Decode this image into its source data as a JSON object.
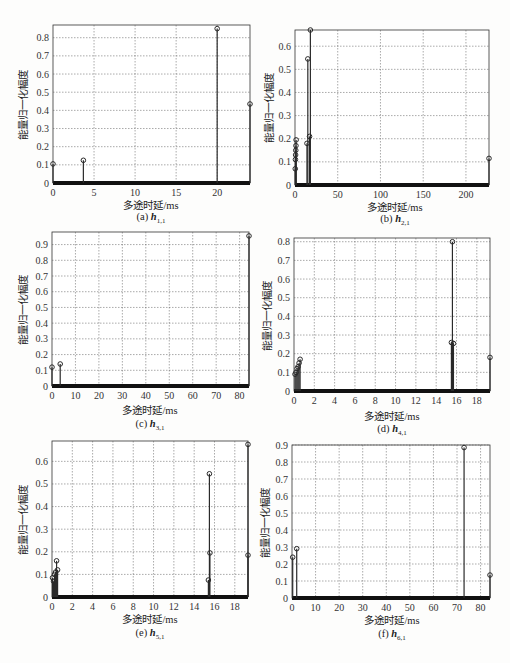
{
  "figure": {
    "xlabel": "多途时延/ms",
    "ylabel": "能量归一化幅度"
  },
  "colors": {
    "stem": "#2a2a2a",
    "grid": "#555555",
    "frame": "#333333",
    "baseline": "#111111"
  },
  "chart_data": [
    {
      "id": "a",
      "type": "stem",
      "caption": "(a)",
      "symbol": "h",
      "subscript": "1,1",
      "xlabel": "多途时延/ms",
      "ylabel": "能量归一化幅度",
      "xlim": [
        0,
        24
      ],
      "ylim": [
        0,
        0.87
      ],
      "xticks": [
        0,
        5,
        10,
        15,
        20
      ],
      "yticks": [
        0,
        0.1,
        0.2,
        0.3,
        0.4,
        0.5,
        0.6,
        0.7,
        0.8
      ],
      "grid": true,
      "x": [
        0,
        3.7,
        20,
        24
      ],
      "y": [
        0.105,
        0.125,
        0.85,
        0.435
      ]
    },
    {
      "id": "b",
      "type": "stem",
      "caption": "(b)",
      "symbol": "h",
      "subscript": "2,1",
      "xlabel": "多途时延/ms",
      "ylabel": "能量归一化幅度",
      "xlim": [
        0,
        227
      ],
      "ylim": [
        0,
        0.67
      ],
      "xticks": [
        0,
        50,
        100,
        150,
        200
      ],
      "yticks": [
        0,
        0.1,
        0.2,
        0.3,
        0.4,
        0.5,
        0.6
      ],
      "grid": true,
      "x": [
        0.3,
        0.5,
        0.7,
        0.9,
        1.1,
        1.3,
        14,
        15,
        17,
        18,
        227
      ],
      "y": [
        0.07,
        0.11,
        0.13,
        0.15,
        0.17,
        0.195,
        0.18,
        0.545,
        0.21,
        0.67,
        0.115
      ]
    },
    {
      "id": "c",
      "type": "stem",
      "caption": "(c)",
      "symbol": "h",
      "subscript": "3,1",
      "xlabel": "多途时延/ms",
      "ylabel": "能量归一化幅度",
      "xlim": [
        0,
        84
      ],
      "ylim": [
        0,
        0.98
      ],
      "xticks": [
        0,
        10,
        20,
        30,
        40,
        50,
        60,
        70,
        80
      ],
      "yticks": [
        0,
        0.1,
        0.2,
        0.3,
        0.4,
        0.5,
        0.6,
        0.7,
        0.8,
        0.9
      ],
      "grid": true,
      "x": [
        0,
        3.5,
        84
      ],
      "y": [
        0.12,
        0.14,
        0.955
      ]
    },
    {
      "id": "d",
      "type": "stem",
      "caption": "(d)",
      "symbol": "h",
      "subscript": "4,1",
      "xlabel": "多途时延/ms",
      "ylabel": "能量归一化幅度",
      "xlim": [
        0,
        19.3
      ],
      "ylim": [
        0,
        0.82
      ],
      "xticks": [
        0,
        2,
        4,
        6,
        8,
        10,
        12,
        14,
        16,
        18
      ],
      "yticks": [
        0,
        0.1,
        0.2,
        0.3,
        0.4,
        0.5,
        0.6,
        0.7,
        0.8
      ],
      "grid": true,
      "x": [
        0.1,
        0.2,
        0.3,
        0.4,
        0.5,
        0.6,
        15.5,
        15.6,
        15.7,
        19.3
      ],
      "y": [
        0.09,
        0.1,
        0.12,
        0.13,
        0.15,
        0.17,
        0.26,
        0.8,
        0.255,
        0.18
      ]
    },
    {
      "id": "e",
      "type": "stem",
      "caption": "(e)",
      "symbol": "h",
      "subscript": "5,1",
      "xlabel": "多途时延/ms",
      "ylabel": "能量归一化幅度",
      "xlim": [
        0,
        19.3
      ],
      "ylim": [
        0,
        0.69
      ],
      "xticks": [
        0,
        2,
        4,
        6,
        8,
        10,
        12,
        14,
        16,
        18
      ],
      "yticks": [
        0,
        0.1,
        0.2,
        0.3,
        0.4,
        0.5,
        0.6
      ],
      "grid": true,
      "x": [
        0.05,
        0.15,
        0.25,
        0.35,
        0.45,
        0.55,
        15.4,
        15.5,
        15.55,
        19.3,
        19.32
      ],
      "y": [
        0.085,
        0.07,
        0.1,
        0.11,
        0.16,
        0.12,
        0.075,
        0.545,
        0.195,
        0.675,
        0.185
      ]
    },
    {
      "id": "f",
      "type": "stem",
      "caption": "(f)",
      "symbol": "h",
      "subscript": "6,1",
      "xlabel": "多途时延/ms",
      "ylabel": "能量归一化幅度",
      "xlim": [
        0,
        84
      ],
      "ylim": [
        0,
        0.9
      ],
      "xticks": [
        0,
        10,
        20,
        30,
        40,
        50,
        60,
        70,
        80
      ],
      "yticks": [
        0,
        0.1,
        0.2,
        0.3,
        0.4,
        0.5,
        0.6,
        0.7,
        0.8,
        0.9
      ],
      "grid": true,
      "x": [
        0.3,
        2,
        73,
        84
      ],
      "y": [
        0.24,
        0.29,
        0.885,
        0.135
      ]
    }
  ]
}
